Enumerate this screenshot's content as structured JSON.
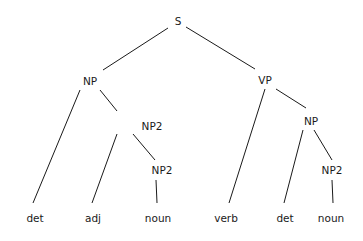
{
  "diagram": {
    "type": "parse-tree",
    "nodes": [
      {
        "id": "s",
        "label": "S",
        "x": 178,
        "y": 21
      },
      {
        "id": "np",
        "label": "NP",
        "x": 90,
        "y": 81
      },
      {
        "id": "vp",
        "label": "VP",
        "x": 265,
        "y": 80
      },
      {
        "id": "np2a",
        "label": "NP2",
        "x": 152,
        "y": 126
      },
      {
        "id": "np_r",
        "label": "NP",
        "x": 311,
        "y": 121
      },
      {
        "id": "np2b",
        "label": "NP2",
        "x": 162,
        "y": 170
      },
      {
        "id": "np2c",
        "label": "NP2",
        "x": 332,
        "y": 170
      },
      {
        "id": "det1",
        "label": "det",
        "x": 35,
        "y": 218
      },
      {
        "id": "adj",
        "label": "adj",
        "x": 93,
        "y": 218
      },
      {
        "id": "noun1",
        "label": "noun",
        "x": 158,
        "y": 218
      },
      {
        "id": "verb",
        "label": "verb",
        "x": 226,
        "y": 218
      },
      {
        "id": "det2",
        "label": "det",
        "x": 285,
        "y": 218
      },
      {
        "id": "noun2",
        "label": "noun",
        "x": 331,
        "y": 218
      }
    ],
    "edges": [
      {
        "from": "s",
        "to": "np",
        "x1": 168,
        "y1": 28,
        "x2": 103,
        "y2": 70
      },
      {
        "from": "s",
        "to": "vp",
        "x1": 186,
        "y1": 27,
        "x2": 255,
        "y2": 69
      },
      {
        "from": "np",
        "to": "det1",
        "x1": 80,
        "y1": 90,
        "x2": 33,
        "y2": 203
      },
      {
        "from": "np",
        "to": "np2a",
        "x1": 100,
        "y1": 90,
        "x2": 117,
        "y2": 111
      },
      {
        "from": "np2a",
        "to": "adj",
        "x1": 117,
        "y1": 134,
        "x2": 92,
        "y2": 203
      },
      {
        "from": "np2a",
        "to": "np2b",
        "x1": 133,
        "y1": 134,
        "x2": 155,
        "y2": 160
      },
      {
        "from": "np2b",
        "to": "noun1",
        "x1": 156,
        "y1": 180,
        "x2": 157,
        "y2": 203
      },
      {
        "from": "vp",
        "to": "verb",
        "x1": 265,
        "y1": 89,
        "x2": 229,
        "y2": 203
      },
      {
        "from": "vp",
        "to": "np_r",
        "x1": 276,
        "y1": 89,
        "x2": 306,
        "y2": 108
      },
      {
        "from": "np_r",
        "to": "det2",
        "x1": 303,
        "y1": 130,
        "x2": 284,
        "y2": 203
      },
      {
        "from": "np_r",
        "to": "np2c",
        "x1": 314,
        "y1": 130,
        "x2": 332,
        "y2": 160
      },
      {
        "from": "np2c",
        "to": "noun2",
        "x1": 332,
        "y1": 180,
        "x2": 333,
        "y2": 203
      }
    ]
  }
}
